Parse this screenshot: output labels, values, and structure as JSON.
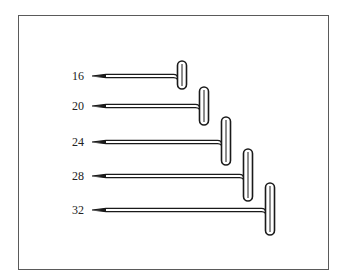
{
  "figure": {
    "pins": [
      {
        "label": "16",
        "y": 76,
        "tip_x": 92,
        "head_x": 182,
        "head_top": 61,
        "head_bottom": 89
      },
      {
        "label": "20",
        "y": 106,
        "tip_x": 92,
        "head_x": 204,
        "head_top": 87,
        "head_bottom": 125
      },
      {
        "label": "24",
        "y": 142,
        "tip_x": 92,
        "head_x": 226,
        "head_top": 117,
        "head_bottom": 165
      },
      {
        "label": "28",
        "y": 176,
        "tip_x": 92,
        "head_x": 248,
        "head_top": 149,
        "head_bottom": 201
      },
      {
        "label": "32",
        "y": 210,
        "tip_x": 92,
        "head_x": 270,
        "head_top": 183,
        "head_bottom": 235
      }
    ],
    "stroke_color": "#1a1a1a",
    "border_color": "#5a5a5a"
  }
}
